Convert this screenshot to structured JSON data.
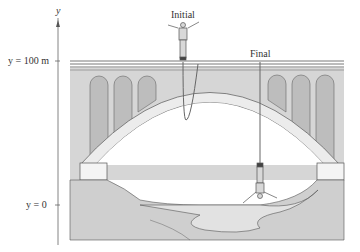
{
  "figure": {
    "axis": {
      "name": "y",
      "label_top": "y = 100 m",
      "label_bottom": "y = 0"
    },
    "positions": {
      "initial_label": "Initial",
      "final_label": "Final"
    },
    "colors": {
      "bridge_fill": "#d6d6d6",
      "arch_fill": "#ececec",
      "arch_niche": "#bdbdbd",
      "ground": "#cfcfcf",
      "water": "#e2e2e2",
      "lines": "#555555"
    }
  }
}
